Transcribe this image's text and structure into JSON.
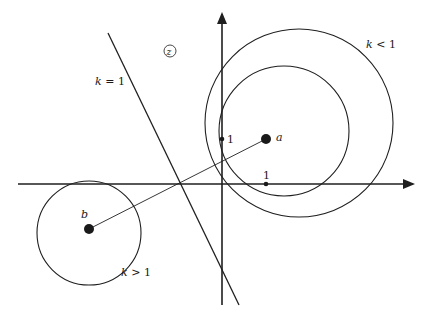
{
  "diagram": {
    "plane_label": "z",
    "colors": {
      "ink": "#1f1f1f",
      "background": "#ffffff"
    },
    "axes": {
      "x_axis": {
        "from": [
          18,
          184
        ],
        "to": [
          415,
          184
        ]
      },
      "y_axis": {
        "from": [
          222,
          305
        ],
        "to": [
          222,
          12
        ]
      },
      "unit_x_label": "1",
      "unit_y_label": "1",
      "unit_x_point": [
        266,
        184
      ],
      "unit_y_point": [
        222,
        139
      ]
    },
    "points": [
      {
        "name": "a",
        "label": "a",
        "x": 266,
        "y": 139
      },
      {
        "name": "b",
        "label": "b",
        "x": 89,
        "y": 229
      }
    ],
    "segment_ab": {
      "from": [
        89,
        229
      ],
      "to": [
        266,
        139
      ]
    },
    "curves": [
      {
        "name": "k-less-than-1-outer",
        "type": "circle",
        "cx": 299,
        "cy": 123,
        "r": 94,
        "label": "k < 1"
      },
      {
        "name": "k-less-than-1-inner",
        "type": "circle",
        "cx": 284,
        "cy": 131,
        "r": 65
      },
      {
        "name": "k-greater-than-1",
        "type": "circle",
        "cx": 89,
        "cy": 233,
        "r": 52,
        "label": "k > 1"
      },
      {
        "name": "k-equals-1",
        "type": "line",
        "from": [
          108,
          33
        ],
        "to": [
          239,
          305
        ],
        "label": "k = 1"
      }
    ],
    "labels": {
      "k_eq_1": "k = 1",
      "k_lt_1": "k < 1",
      "k_gt_1": "k > 1",
      "a": "a",
      "b": "b",
      "one_x": "1",
      "one_y": "1",
      "z": "z"
    }
  }
}
